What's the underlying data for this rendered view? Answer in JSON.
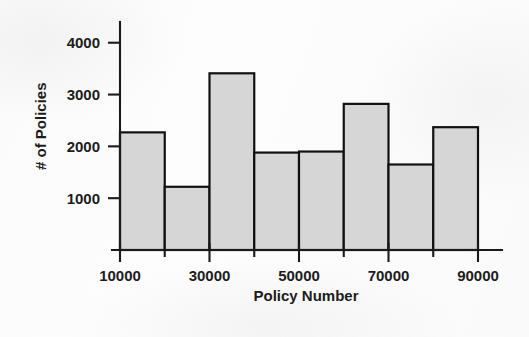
{
  "chart_data": {
    "type": "bar",
    "title": "",
    "subtitle": "",
    "xlabel": "Policy Number",
    "ylabel": "# of Policies",
    "categories": [
      "10000-20000",
      "20000-30000",
      "30000-40000",
      "40000-50000",
      "50000-60000",
      "60000-70000",
      "70000-80000",
      "80000-90000"
    ],
    "bin_edges": [
      10000,
      20000,
      30000,
      40000,
      50000,
      60000,
      70000,
      80000,
      90000
    ],
    "values": [
      2270,
      1220,
      3410,
      1880,
      1900,
      2820,
      1650,
      2370
    ],
    "series": [
      {
        "name": "# of Policies",
        "values": [
          2270,
          1220,
          3410,
          1880,
          1900,
          2820,
          1650,
          2370
        ]
      }
    ],
    "xlim": [
      10000,
      90000
    ],
    "ylim": [
      0,
      4400
    ],
    "x_tick_labels": [
      "10000",
      "30000",
      "50000",
      "70000",
      "90000"
    ],
    "x_tick_values": [
      10000,
      30000,
      50000,
      70000,
      90000
    ],
    "x_minor_tick_values": [
      20000,
      40000,
      60000,
      80000
    ],
    "y_tick_labels": [
      "1000",
      "2000",
      "3000",
      "4000"
    ],
    "y_tick_values": [
      1000,
      2000,
      3000,
      4000
    ],
    "grid": false,
    "legend": false,
    "legend_position": "none",
    "bar_fill_color": "#d6d6d6",
    "bar_edge_color": "#111111",
    "axis_color": "#1a1a1a",
    "background_color": "#fdfdfd"
  }
}
